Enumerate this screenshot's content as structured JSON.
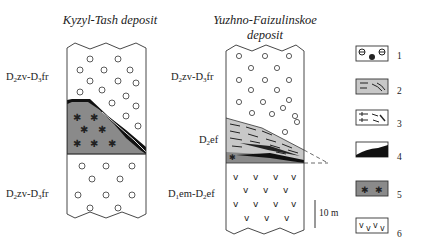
{
  "diagram": {
    "type": "stratigraphic-columns",
    "columns": [
      {
        "title": "Kyzyl-Tash deposit",
        "units": [
          {
            "label_main": "D",
            "sub1": "2",
            "mid": "zv-D",
            "sub2": "3",
            "end": "fr",
            "lithology": "1",
            "position": "upper"
          },
          {
            "label": "ore body",
            "lithology": "5 with 4 contact",
            "position": "middle"
          },
          {
            "label_main": "D",
            "sub1": "2",
            "mid": "zv-D",
            "sub2": "3",
            "end": "fr",
            "lithology": "1",
            "position": "lower"
          }
        ]
      },
      {
        "title_line1": "Yuzhno-Faizulinskoe",
        "title_line2": "deposit",
        "units": [
          {
            "label_main": "D",
            "sub1": "2",
            "mid": "zv-D",
            "sub2": "3",
            "end": "fr",
            "lithology": "1",
            "position": "upper"
          },
          {
            "label_main": "D",
            "sub1": "2",
            "end": "ef",
            "lithology": "2, 3, 4, 5",
            "position": "middle"
          },
          {
            "label_main": "D",
            "sub1": "1",
            "mid": "em-D",
            "sub2": "2",
            "end": "ef",
            "lithology": "6",
            "position": "lower"
          }
        ]
      }
    ],
    "scale_bar": "10 m",
    "legend": [
      {
        "num": "1",
        "pattern": "circles"
      },
      {
        "num": "2",
        "pattern": "grey-dashes"
      },
      {
        "num": "3",
        "pattern": "arrows"
      },
      {
        "num": "4",
        "pattern": "black-lens"
      },
      {
        "num": "5",
        "pattern": "dark-grey-asterisks"
      },
      {
        "num": "6",
        "pattern": "v-marks"
      }
    ],
    "colors": {
      "grey_light": "#c8c8c8",
      "grey_dark": "#8a8a8a",
      "line": "#333333"
    }
  }
}
